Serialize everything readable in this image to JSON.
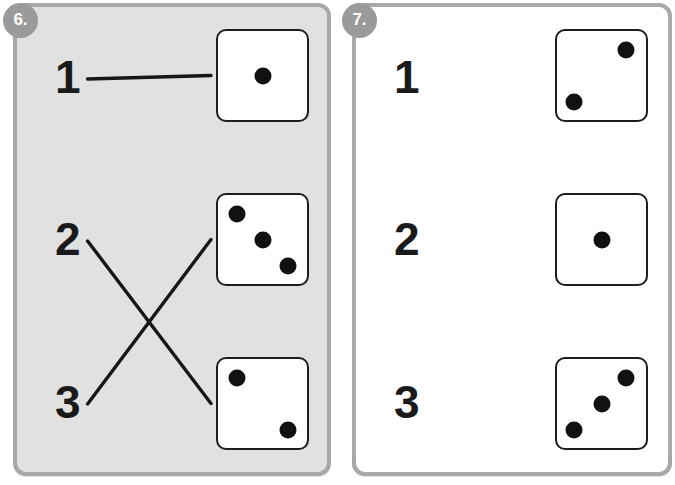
{
  "page": {
    "background": "#ffffff",
    "ink": "#1a1a1a",
    "line_color": "#161616"
  },
  "panels": [
    {
      "badge": "6.",
      "badge_color": "#9a9a9a",
      "background": "#e1e1e1",
      "border_color": "#a8a8a8",
      "numbers": [
        {
          "label": "1"
        },
        {
          "label": "2"
        },
        {
          "label": "3"
        }
      ],
      "dice": [
        {
          "pips": 1,
          "pip_positions": [
            "center"
          ]
        },
        {
          "pips": 3,
          "pip_positions": [
            "top-left",
            "center",
            "bottom-right"
          ]
        },
        {
          "pips": 2,
          "pip_positions": [
            "top-left",
            "bottom-right"
          ]
        }
      ],
      "connections": [
        {
          "from_number": 0,
          "to_die": 0
        },
        {
          "from_number": 1,
          "to_die": 2
        },
        {
          "from_number": 2,
          "to_die": 1
        }
      ]
    },
    {
      "badge": "7.",
      "badge_color": "#9a9a9a",
      "background": "#ffffff",
      "border_color": "#a8a8a8",
      "numbers": [
        {
          "label": "1"
        },
        {
          "label": "2"
        },
        {
          "label": "3"
        }
      ],
      "dice": [
        {
          "pips": 2,
          "pip_positions": [
            "top-right",
            "bottom-left"
          ]
        },
        {
          "pips": 1,
          "pip_positions": [
            "center"
          ]
        },
        {
          "pips": 3,
          "pip_positions": [
            "top-right",
            "center",
            "bottom-left"
          ]
        }
      ],
      "connections": []
    }
  ]
}
